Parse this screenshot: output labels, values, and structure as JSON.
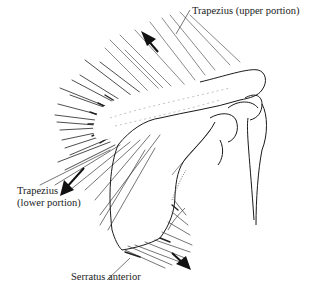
{
  "figure": {
    "labels": {
      "trapezius_upper": "Trapezius (upper portion)",
      "trapezius_lower_line1": "Trapezius",
      "trapezius_lower_line2": "(lower portion)",
      "serratus_anterior": "Serratus anterior"
    },
    "icons": {
      "arrow_upper": "arrow-up-left-icon",
      "arrow_lower": "arrow-down-left-icon",
      "arrow_serratus": "arrow-down-right-icon"
    },
    "colors": {
      "ink": "#1a1a1a",
      "hatching": "#3a3a3a",
      "background": "#ffffff"
    }
  }
}
